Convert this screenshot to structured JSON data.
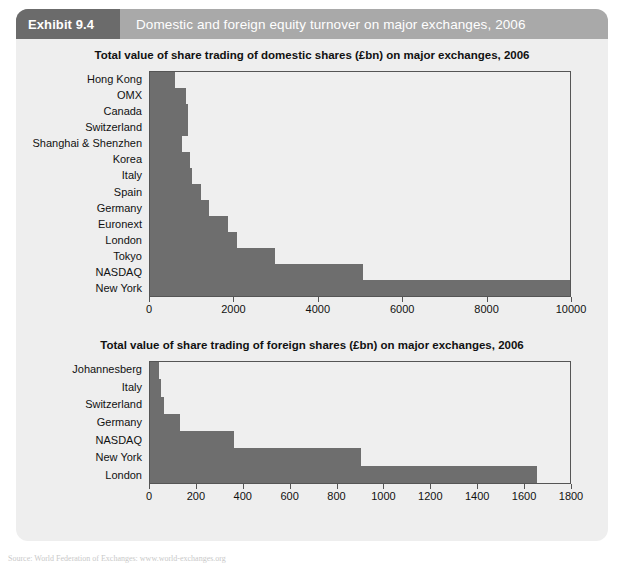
{
  "exhibit": {
    "tag_label": "Exhibit 9.4",
    "caption": "Domestic and foreign equity turnover on major exchanges, 2006",
    "tag_bg_color": "#6b6b6b",
    "header_bg_color": "#a9a9a9",
    "panel_bg_color": "#eeeeee",
    "bar_color": "#6e6e6e"
  },
  "source_note": "Source: World Federation of Exchanges: www.world-exchanges.org",
  "chart_data": [
    {
      "type": "bar",
      "orientation": "horizontal",
      "title": "Total value of share trading of domestic shares (£bn) on major exchanges, 2006",
      "xlabel": "",
      "ylabel": "",
      "xlim": [
        0,
        10000
      ],
      "grid": false,
      "legend": "none",
      "xticks": [
        0,
        2000,
        4000,
        6000,
        8000,
        10000
      ],
      "xtick_labels": [
        "0",
        "2000",
        "4000",
        "6000",
        "8000",
        "10000"
      ],
      "categories": [
        "Hong Kong",
        "OMX",
        "Canada",
        "Switzerland",
        "Shanghai & Shenzhen",
        "Korea",
        "Italy",
        "Spain",
        "Germany",
        "Euronext",
        "London",
        "Tokyo",
        "NASDAQ",
        "New York"
      ],
      "values": [
        600,
        850,
        900,
        900,
        750,
        950,
        1000,
        1200,
        1400,
        1850,
        2050,
        2970,
        5040,
        10000
      ]
    },
    {
      "type": "bar",
      "orientation": "horizontal",
      "title": "Total value of share trading of foreign shares (£bn) on major exchanges, 2006",
      "xlabel": "",
      "ylabel": "",
      "xlim": [
        0,
        1800
      ],
      "grid": false,
      "legend": "none",
      "xticks": [
        0,
        200,
        400,
        600,
        800,
        1000,
        1200,
        1400,
        1600,
        1800
      ],
      "xtick_labels": [
        "0",
        "200",
        "400",
        "600",
        "800",
        "1000",
        "1200",
        "1400",
        "1600",
        "1800"
      ],
      "categories": [
        "Johannesberg",
        "Italy",
        "Switzerland",
        "Germany",
        "NASDAQ",
        "New York",
        "London"
      ],
      "values": [
        40,
        45,
        60,
        130,
        360,
        900,
        1650
      ]
    }
  ]
}
